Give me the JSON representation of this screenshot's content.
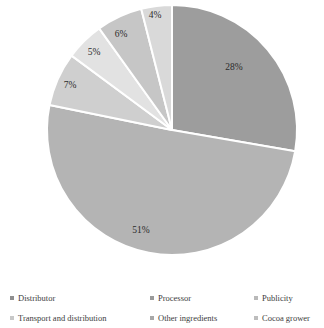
{
  "chart_data": {
    "type": "pie",
    "title": "",
    "subtitle": "",
    "xlabel": "",
    "ylabel": "",
    "legend_position": "bottom",
    "grid": false,
    "categories": [
      "Distributor",
      "Processor",
      "Publicity",
      "Transport and distribution",
      "Other ingredients",
      "Cocoa grower"
    ],
    "values": [
      28,
      51,
      7,
      5,
      6,
      4
    ],
    "value_labels": [
      "28%",
      "51%",
      "7%",
      "5%",
      "6%",
      "4%"
    ],
    "colors": [
      "#9d9d9d",
      "#b4b4b4",
      "#cfcfcf",
      "#e2e2e2",
      "#c6c6c6",
      "#d9d9d9"
    ],
    "slice_order_clockwise_from_top": [
      "Distributor",
      "Processor",
      "Publicity",
      "Transport and distribution",
      "Other ingredients",
      "Cocoa grower"
    ],
    "separator_color": "#ffffff",
    "background_color": "#ffffff"
  },
  "pie": {
    "center_x": 172,
    "center_y": 130,
    "radius": 125,
    "slices": [
      {
        "label": "Distributor",
        "percent_label": "28%",
        "value": 28,
        "color": "#9d9d9d",
        "label_x": 234,
        "label_y": 68
      },
      {
        "label": "Processor",
        "percent_label": "51%",
        "value": 51,
        "color": "#b4b4b4",
        "label_x": 141,
        "label_y": 231
      },
      {
        "label": "Publicity",
        "percent_label": "7%",
        "value": 7,
        "color": "#cfcfcf",
        "label_x": 70,
        "label_y": 86
      },
      {
        "label": "Transport and distribution",
        "percent_label": "5%",
        "value": 5,
        "color": "#e2e2e2",
        "label_x": 94,
        "label_y": 53
      },
      {
        "label": "Other ingredients",
        "percent_label": "6%",
        "value": 6,
        "color": "#c6c6c6",
        "label_x": 121,
        "label_y": 35
      },
      {
        "label": "Cocoa grower",
        "percent_label": "4%",
        "value": 4,
        "color": "#d9d9d9",
        "label_x": 155,
        "label_y": 16
      }
    ]
  },
  "legend": {
    "items": [
      {
        "label": "Distributor",
        "color": "#8f8f8f"
      },
      {
        "label": "Processor",
        "color": "#9a9a9a"
      },
      {
        "label": "Publicity",
        "color": "#b9b9b9"
      },
      {
        "label": "Transport and distribution",
        "color": "#c8c8c8"
      },
      {
        "label": "Other ingredients",
        "color": "#a8a8a8"
      },
      {
        "label": "Cocoa grower",
        "color": "#bdbdbd"
      }
    ]
  }
}
